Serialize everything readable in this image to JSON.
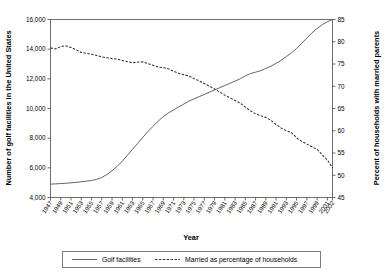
{
  "chart_data": {
    "type": "line",
    "title": "",
    "xlabel": "Year",
    "ylabel": "Number of golf facilities in the United States",
    "y2label": "Percent of households with married parents",
    "grid": false,
    "legend_position": "bottom",
    "xlim": [
      1947,
      2002
    ],
    "ylim": [
      4000,
      16000
    ],
    "y2lim": [
      45,
      85
    ],
    "yticks": [
      "4,000",
      "6,000",
      "8,000",
      "10,000",
      "12,000",
      "14,000",
      "16,000"
    ],
    "ytick_values": [
      4000,
      6000,
      8000,
      10000,
      12000,
      14000,
      16000
    ],
    "y2ticks": [
      "45",
      "50",
      "55",
      "60",
      "65",
      "70",
      "75",
      "80",
      "85"
    ],
    "y2tick_values": [
      45,
      50,
      55,
      60,
      65,
      70,
      75,
      80,
      85
    ],
    "xticks": [
      "1947",
      "1949",
      "1951",
      "1953",
      "1955",
      "1957",
      "1959",
      "1961",
      "1963",
      "1965",
      "1967",
      "1969",
      "1971",
      "1973",
      "1975",
      "1977",
      "1979",
      "1981",
      "1983",
      "1985",
      "1987",
      "1989",
      "1991",
      "1993",
      "1995",
      "1997",
      "1999",
      "2001",
      "2002"
    ],
    "xtick_values": [
      1947,
      1949,
      1951,
      1953,
      1955,
      1957,
      1959,
      1961,
      1963,
      1965,
      1967,
      1969,
      1971,
      1973,
      1975,
      1977,
      1979,
      1981,
      1983,
      1985,
      1987,
      1989,
      1991,
      1993,
      1995,
      1997,
      1999,
      2001,
      2002
    ],
    "x": [
      1947,
      1948,
      1949,
      1950,
      1951,
      1952,
      1953,
      1954,
      1955,
      1956,
      1957,
      1958,
      1959,
      1960,
      1961,
      1962,
      1963,
      1964,
      1965,
      1966,
      1967,
      1968,
      1969,
      1970,
      1971,
      1972,
      1973,
      1974,
      1975,
      1976,
      1977,
      1978,
      1979,
      1980,
      1981,
      1982,
      1983,
      1984,
      1985,
      1986,
      1987,
      1988,
      1989,
      1990,
      1991,
      1992,
      1993,
      1994,
      1995,
      1996,
      1997,
      1998,
      1999,
      2000,
      2001,
      2002
    ],
    "series": [
      {
        "name": "Golf facilities",
        "axis": "left",
        "style": "solid",
        "color": "#5b5b5b",
        "values": [
          4900,
          4920,
          4940,
          4960,
          4990,
          5020,
          5060,
          5100,
          5150,
          5220,
          5350,
          5550,
          5800,
          6100,
          6450,
          6850,
          7250,
          7650,
          8050,
          8450,
          8800,
          9150,
          9450,
          9700,
          9900,
          10100,
          10300,
          10500,
          10650,
          10800,
          10950,
          11100,
          11250,
          11400,
          11550,
          11700,
          11850,
          12000,
          12200,
          12350,
          12450,
          12550,
          12700,
          12850,
          13050,
          13250,
          13500,
          13750,
          14050,
          14400,
          14750,
          15100,
          15400,
          15650,
          15850,
          16000
        ]
      },
      {
        "name": "Married as percentage of households",
        "axis": "right",
        "style": "dashed",
        "color": "#2e2e2e",
        "values": [
          78.6,
          78.4,
          78.9,
          79.1,
          78.7,
          78.2,
          77.6,
          77.4,
          77.2,
          76.9,
          76.6,
          76.4,
          76.2,
          76.1,
          75.8,
          75.5,
          75.3,
          75.4,
          75.5,
          75.1,
          74.7,
          74.3,
          74.2,
          73.9,
          73.4,
          72.9,
          72.6,
          72.3,
          71.7,
          71.2,
          70.6,
          70.0,
          69.4,
          68.7,
          68.0,
          67.4,
          66.8,
          66.2,
          65.3,
          64.5,
          63.8,
          63.4,
          63.0,
          62.3,
          61.4,
          60.6,
          60.0,
          59.6,
          58.4,
          57.6,
          57.0,
          56.4,
          55.8,
          54.6,
          53.4,
          51.7
        ]
      }
    ],
    "legend": [
      {
        "label": "Golf facilities",
        "style": "solid"
      },
      {
        "label": "Married as percentage of households",
        "style": "dashed"
      }
    ]
  }
}
